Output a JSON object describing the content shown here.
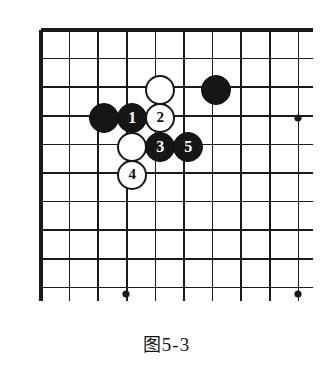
{
  "figure": {
    "caption_cjk": "图",
    "caption_number": "5-3",
    "caption_full": "图 5-3"
  },
  "board": {
    "type": "go-board-diagram",
    "description": "Go board upper-left corner, partial view",
    "visible_columns": 10,
    "visible_rows": 10,
    "grid_spacing_px": 28.6,
    "origin_x_px": 41,
    "origin_y_px": 30,
    "line_color": "#1a1a1a",
    "edge_color": "#111111",
    "background_color": "#ffffff",
    "edges": {
      "top": true,
      "left": true,
      "right": false,
      "bottom": false
    },
    "star_points": [
      {
        "col": 9,
        "row": 3,
        "x": 298,
        "y": 118
      },
      {
        "col": 3,
        "row": 9,
        "x": 126,
        "y": 294
      },
      {
        "col": 9,
        "row": 9,
        "x": 298,
        "y": 294
      }
    ]
  },
  "stones": [
    {
      "id": "white-unnumbered-top",
      "color": "white",
      "label": "",
      "col": 4,
      "row": 2,
      "x": 160,
      "y": 90,
      "radius": 15
    },
    {
      "id": "black-unnumbered-right",
      "color": "black",
      "label": "",
      "col": 6,
      "row": 2,
      "x": 216,
      "y": 90,
      "radius": 15
    },
    {
      "id": "black-unnumbered-left",
      "color": "black",
      "label": "",
      "col": 2,
      "row": 3,
      "x": 104,
      "y": 118,
      "radius": 15
    },
    {
      "id": "black-move-1",
      "color": "black",
      "label": "1",
      "col": 3,
      "row": 3,
      "x": 132,
      "y": 118,
      "radius": 15
    },
    {
      "id": "white-move-2",
      "color": "white",
      "label": "2",
      "col": 4,
      "row": 3,
      "x": 160,
      "y": 118,
      "radius": 15
    },
    {
      "id": "white-unnumbered-mid",
      "color": "white",
      "label": "",
      "col": 3,
      "row": 4,
      "x": 132,
      "y": 147,
      "radius": 15
    },
    {
      "id": "black-move-3",
      "color": "black",
      "label": "3",
      "col": 4,
      "row": 4,
      "x": 160,
      "y": 147,
      "radius": 15
    },
    {
      "id": "black-move-5",
      "color": "black",
      "label": "5",
      "col": 5,
      "row": 4,
      "x": 188,
      "y": 147,
      "radius": 15
    },
    {
      "id": "white-move-4",
      "color": "white",
      "label": "4",
      "col": 3,
      "row": 5,
      "x": 132,
      "y": 175,
      "radius": 15
    }
  ]
}
